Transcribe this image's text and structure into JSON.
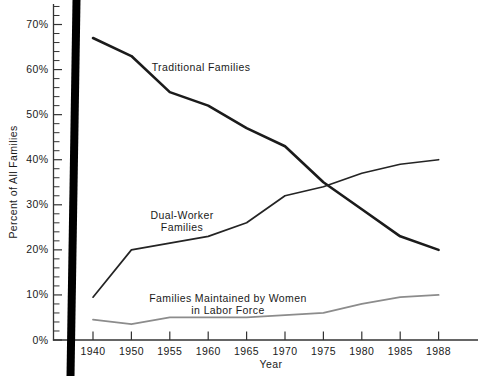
{
  "chart_data": {
    "type": "line",
    "title": "",
    "xlabel": "Year",
    "ylabel": "Percent of All Families",
    "categories": [
      "1940",
      "1950",
      "1955",
      "1960",
      "1965",
      "1970",
      "1975",
      "1980",
      "1985",
      "1988"
    ],
    "series": [
      {
        "name": "Traditional Families",
        "values": [
          67,
          63,
          55,
          52,
          47,
          43,
          35,
          29,
          23,
          20
        ],
        "color": "#1b1b1b",
        "stroke_width": 2.6,
        "annotation": {
          "lines": [
            "Traditional Families"
          ],
          "x": 201,
          "y": 71,
          "line_height": 12
        }
      },
      {
        "name": "Dual-Worker Families",
        "values": [
          9.5,
          20,
          21.5,
          23,
          26,
          32,
          34,
          37,
          39,
          40
        ],
        "color": "#242424",
        "stroke_width": 1.7,
        "annotation": {
          "lines": [
            "Dual-Worker",
            "Families"
          ],
          "x": 182,
          "y": 219,
          "line_height": 12
        }
      },
      {
        "name": "Families Maintained by Women in Labor Force",
        "values": [
          4.5,
          3.5,
          5,
          5,
          5,
          5.5,
          6,
          8,
          9.5,
          10
        ],
        "color": "#8c8c8c",
        "stroke_width": 1.8,
        "annotation": {
          "lines": [
            "Families Maintained by Women",
            "in Labor Force"
          ],
          "x": 228,
          "y": 302,
          "line_height": 12
        }
      }
    ],
    "ytick_labels": [
      "0%",
      "10%",
      "20%",
      "30%",
      "40%",
      "50%",
      "60%",
      "70%"
    ],
    "yticks": [
      0,
      10,
      20,
      30,
      40,
      50,
      60,
      70
    ],
    "ylim": [
      0,
      74
    ],
    "ytick_minor_step": 2,
    "grid": false,
    "legend": "inline-annotations",
    "axis_color": "#333333",
    "text_color": "#1a1a1a"
  },
  "artifacts": {
    "left_black_bar_color": "#000000"
  }
}
